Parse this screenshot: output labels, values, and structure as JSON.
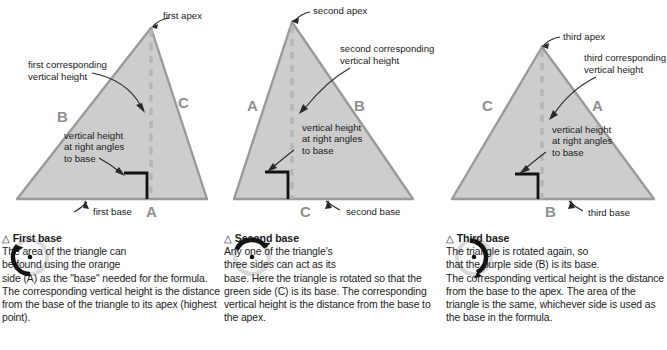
{
  "page": {
    "background": "#ffffff",
    "text_color": "#1b1b1b",
    "triangle_fill": "#cdcdcd",
    "triangle_edge": "#9a9a9a",
    "dashed_height_color": "#b6b6b6",
    "right_angle_color": "#111111",
    "side_label_color": "#8f8f8f",
    "arc_dark": "#111111",
    "arc_light": "#d9d9d9"
  },
  "panels": [
    {
      "id": "first",
      "figure": {
        "apex_label": "first apex",
        "height_label_line1": "first corresponding",
        "height_label_line2": "vertical height",
        "right_angle_line1": "vertical height",
        "right_angle_line2": "at right angles",
        "right_angle_line3": "to base",
        "base_label": "first base",
        "side_labels": [
          {
            "name": "A",
            "text": "A"
          },
          {
            "name": "B",
            "text": "B"
          },
          {
            "name": "C",
            "text": "C"
          }
        ]
      },
      "caption": {
        "icon": "rotate-arrow-icon",
        "triangle_glyph": "△",
        "heading": "First base",
        "line1": "The area of the triangle can",
        "line2": "be found using the orange",
        "body": "side (A) as the \"base\" needed for the formula. The corresponding vertical height is the distance from the base of the triangle to its apex (highest point)."
      }
    },
    {
      "id": "second",
      "figure": {
        "apex_label": "second apex",
        "height_label_line1": "second corresponding",
        "height_label_line2": "vertical height",
        "right_angle_line1": "vertical height",
        "right_angle_line2": "at right angles",
        "right_angle_line3": "to base",
        "base_label": "second base",
        "side_labels": [
          {
            "name": "A",
            "text": "A"
          },
          {
            "name": "B",
            "text": "B"
          },
          {
            "name": "C",
            "text": "C"
          }
        ]
      },
      "caption": {
        "icon": "rotate-arrow-icon",
        "triangle_glyph": "△",
        "heading": "Second base",
        "line1": "Any one of the triangle's",
        "line2": "three sides can act as its",
        "body": "base. Here the triangle is rotated so that the green side (C) is its base. The corresponding vertical height is the distance from the base to the apex."
      }
    },
    {
      "id": "third",
      "figure": {
        "apex_label": "third apex",
        "height_label_line1": "third corresponding",
        "height_label_line2": "vertical height",
        "right_angle_line1": "vertical height",
        "right_angle_line2": "at right angles",
        "right_angle_line3": "to base",
        "base_label": "third base",
        "side_labels": [
          {
            "name": "A",
            "text": "A"
          },
          {
            "name": "B",
            "text": "B"
          },
          {
            "name": "C",
            "text": "C"
          }
        ]
      },
      "caption": {
        "icon": "rotate-arrow-icon",
        "triangle_glyph": "△",
        "heading": "Third base",
        "line1": "The triangle is rotated again, so",
        "line2": "that the purple side (B) is its base.",
        "body": "The corresponding vertical height is the distance from the base to the apex. The area of the triangle is the same, whichever side is used as the base in the formula."
      }
    }
  ]
}
